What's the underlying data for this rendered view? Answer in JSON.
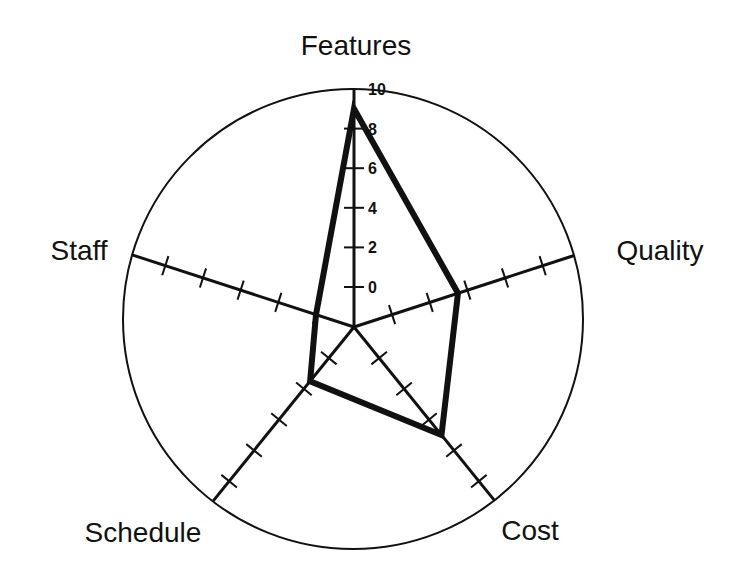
{
  "chart_data": {
    "type": "radar",
    "title": "",
    "axes": [
      "Features",
      "Quality",
      "Cost",
      "Schedule",
      "Staff"
    ],
    "series": [
      {
        "name": "",
        "values": [
          9,
          3.5,
          5,
          1.5,
          0
        ]
      }
    ],
    "scale": {
      "min": 0,
      "max": 10,
      "tick_step": 2
    },
    "tick_labels": [
      "0",
      "2",
      "4",
      "6",
      "8",
      "10"
    ],
    "tick_label_axis": "Features",
    "grid": false,
    "legend": null
  },
  "style": {
    "line_color": "#111111",
    "background": "#ffffff"
  }
}
